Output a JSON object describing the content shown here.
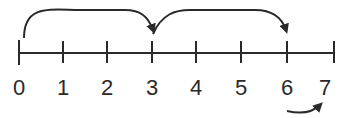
{
  "diagram": {
    "type": "number-line",
    "ticks": [
      {
        "value": "0",
        "x": 19
      },
      {
        "value": "1",
        "x": 63
      },
      {
        "value": "2",
        "x": 107
      },
      {
        "value": "3",
        "x": 152
      },
      {
        "value": "4",
        "x": 196
      },
      {
        "value": "5",
        "x": 241
      },
      {
        "value": "6",
        "x": 287
      },
      {
        "value": "7",
        "x": 334
      }
    ],
    "jumps": [
      {
        "from": "0",
        "to": "3",
        "position": "above"
      },
      {
        "from": "3",
        "to": "6",
        "position": "above"
      },
      {
        "from": "6",
        "to": "7",
        "position": "below"
      }
    ],
    "line_color": "#2a2a2a"
  }
}
